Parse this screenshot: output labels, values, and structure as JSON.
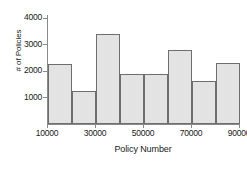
{
  "chart_data": {
    "type": "bar",
    "title": "",
    "xlabel": "Policy Number",
    "ylabel": "# of Policies",
    "categories": [
      "10000-20000",
      "20000-30000",
      "30000-40000",
      "40000-50000",
      "50000-60000",
      "60000-70000",
      "70000-80000",
      "80000-90000"
    ],
    "bin_edges": [
      10000,
      20000,
      30000,
      40000,
      50000,
      60000,
      70000,
      80000,
      90000
    ],
    "values": [
      2250,
      1230,
      3390,
      1870,
      1890,
      2790,
      1640,
      2310
    ],
    "xlim": [
      10000,
      90000
    ],
    "ylim": [
      0,
      4300
    ],
    "xticks": [
      10000,
      30000,
      50000,
      70000,
      90000
    ],
    "xtick_labels": [
      "10000",
      "30000",
      "50000",
      "70000",
      "90000"
    ],
    "yticks": [
      1000,
      2000,
      3000,
      4000
    ],
    "ytick_labels": [
      "1000",
      "2000",
      "3000",
      "4000"
    ],
    "grid": false,
    "legend": null,
    "bar_fill_color": "#e3e3e3",
    "bar_edge_color": "#6e6e6e",
    "axis_color": "#8a8a8a"
  }
}
